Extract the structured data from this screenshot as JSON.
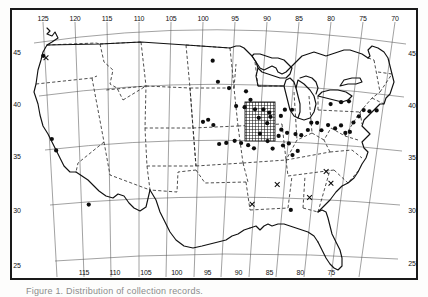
{
  "figure": {
    "type": "distribution-map",
    "region": "contiguous-united-states",
    "caption": "Figure 1. Distribution of collection records.",
    "frame_color": "#1a1a1a",
    "background_color": "#ffffff",
    "ink_color": "#111111"
  },
  "axes": {
    "longitude_label_top": [
      "125",
      "120",
      "115",
      "110",
      "105",
      "100",
      "95",
      "90",
      "85",
      "80",
      "75",
      "70"
    ],
    "longitude_label_bottom": [
      "115",
      "110",
      "105",
      "100",
      "95",
      "90",
      "85",
      "80",
      "75"
    ],
    "latitude_label_left": [
      "45",
      "40",
      "35",
      "30",
      "25"
    ],
    "latitude_label_right": [
      "45",
      "40",
      "35",
      "30",
      "25"
    ],
    "graticule_interval_degrees": 5,
    "projection": "conic"
  },
  "legend": {
    "filled_circle": "collection record",
    "cross": "literature record",
    "hatched_area": "area of concentrated records"
  },
  "chart_data": {
    "type": "scatter",
    "title": "Distribution of collection records",
    "xlabel": "Longitude (°W)",
    "ylabel": "Latitude (°N)",
    "xlim": [
      128,
      66
    ],
    "ylim": [
      23,
      50
    ],
    "grid": true,
    "legend_position": "none",
    "series": [
      {
        "name": "collection record",
        "marker": "filled-circle",
        "points": [
          [
            122.4,
            47.6
          ],
          [
            121.6,
            39.7
          ],
          [
            121.0,
            38.6
          ],
          [
            116.2,
            33.4
          ],
          [
            96.7,
            46.9
          ],
          [
            95.9,
            44.9
          ],
          [
            94.2,
            44.3
          ],
          [
            91.6,
            44.0
          ],
          [
            90.9,
            43.2
          ],
          [
            93.1,
            42.6
          ],
          [
            91.8,
            42.5
          ],
          [
            90.2,
            42.3
          ],
          [
            88.9,
            42.3
          ],
          [
            88.0,
            42.0
          ],
          [
            89.6,
            41.5
          ],
          [
            88.3,
            41.0
          ],
          [
            87.8,
            41.6
          ],
          [
            86.2,
            41.7
          ],
          [
            85.6,
            42.3
          ],
          [
            84.5,
            42.3
          ],
          [
            86.1,
            40.4
          ],
          [
            85.2,
            40.1
          ],
          [
            86.5,
            39.8
          ],
          [
            84.9,
            39.1
          ],
          [
            83.9,
            40.0
          ],
          [
            83.0,
            39.9
          ],
          [
            82.0,
            40.4
          ],
          [
            81.5,
            41.1
          ],
          [
            80.6,
            41.1
          ],
          [
            79.9,
            40.4
          ],
          [
            78.9,
            40.9
          ],
          [
            77.8,
            40.6
          ],
          [
            76.9,
            40.9
          ],
          [
            76.2,
            40.2
          ],
          [
            75.5,
            40.3
          ],
          [
            75.0,
            41.2
          ],
          [
            74.2,
            41.8
          ],
          [
            73.5,
            42.4
          ],
          [
            72.6,
            42.3
          ],
          [
            71.5,
            42.4
          ],
          [
            75.8,
            43.2
          ],
          [
            77.0,
            43.1
          ],
          [
            78.6,
            42.9
          ],
          [
            89.4,
            40.0
          ],
          [
            88.2,
            39.3
          ],
          [
            87.4,
            38.6
          ],
          [
            85.8,
            38.9
          ],
          [
            84.3,
            38.0
          ],
          [
            83.5,
            38.4
          ],
          [
            90.3,
            38.6
          ],
          [
            91.2,
            38.9
          ],
          [
            92.3,
            39.1
          ],
          [
            93.3,
            39.3
          ],
          [
            94.6,
            39.1
          ],
          [
            95.7,
            39.0
          ],
          [
            96.6,
            40.8
          ],
          [
            97.4,
            41.3
          ],
          [
            98.2,
            41.1
          ],
          [
            84.4,
            32.8
          ]
        ]
      },
      {
        "name": "literature record",
        "marker": "cross",
        "points": [
          [
            122.0,
            47.4
          ],
          [
            79.0,
            36.5
          ],
          [
            78.2,
            35.4
          ],
          [
            86.6,
            35.2
          ],
          [
            90.5,
            33.3
          ],
          [
            81.5,
            34.0
          ]
        ]
      }
    ],
    "hatched_region": {
      "name": "area of concentrated records",
      "pattern": "cross-hatch-grid",
      "bounds_lonlat": [
        [
          93.0,
          43.2
        ],
        [
          89.6,
          43.2
        ],
        [
          89.6,
          39.6
        ],
        [
          93.0,
          39.6
        ]
      ]
    }
  }
}
